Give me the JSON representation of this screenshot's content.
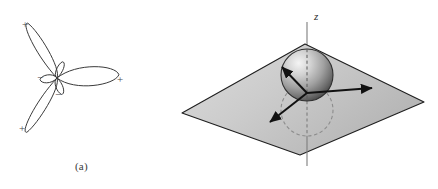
{
  "figure": {
    "panels": [
      {
        "id": "a",
        "caption": "(a)",
        "kind": "orbital-lobe-diagram",
        "description": "Three-lobed angular wavefunction with alternating sign lobes",
        "center": {
          "x": 57,
          "y": 78
        },
        "major_lobes": [
          {
            "angle_deg": 118,
            "length": 62,
            "width": 19,
            "sign": "+",
            "sign_x": 25,
            "sign_y": 25
          },
          {
            "angle_deg": 3,
            "length": 62,
            "width": 19,
            "sign": "+",
            "sign_x": 120,
            "sign_y": 80
          },
          {
            "angle_deg": 241,
            "length": 62,
            "width": 19,
            "sign": "+",
            "sign_x": 22,
            "sign_y": 129
          }
        ],
        "minor_lobes": [
          {
            "angle_deg": 72,
            "length": 17,
            "width": 8,
            "sign": "",
            "sign_x": 0,
            "sign_y": 0
          },
          {
            "angle_deg": 185,
            "length": 17,
            "width": 8,
            "sign": "−",
            "sign_x": 40,
            "sign_y": 78
          },
          {
            "angle_deg": 285,
            "length": 17,
            "width": 8,
            "sign": "−",
            "sign_x": 58,
            "sign_y": 95
          }
        ],
        "signs": {
          "positive": "+",
          "negative": "−"
        }
      },
      {
        "id": "b",
        "caption": "(b)",
        "kind": "sphere-on-plane-diagram",
        "axis_label": "z",
        "plane": {
          "corners": [
            {
              "x": 22,
              "y": 113
            },
            {
              "x": 145,
              "y": 44
            },
            {
              "x": 264,
              "y": 102
            },
            {
              "x": 140,
              "y": 155
            }
          ]
        },
        "sphere": {
          "cx": 147,
          "cy": 75,
          "r": 26
        },
        "shadow_circle": {
          "cx": 147,
          "cy": 110,
          "r": 26
        },
        "axis_line": {
          "x": 147,
          "y_top": 22,
          "y_bottom": 166
        },
        "arrows": [
          {
            "name": "arrow-upper-left",
            "x1": 147,
            "y1": 93,
            "x2": 122,
            "y2": 67
          },
          {
            "name": "arrow-right",
            "x1": 147,
            "y1": 93,
            "x2": 212,
            "y2": 88
          },
          {
            "name": "arrow-lower-left",
            "x1": 147,
            "y1": 93,
            "x2": 110,
            "y2": 122
          }
        ]
      }
    ]
  },
  "colors": {
    "outline": "#3a3a3a",
    "plane_fill_light": "#d8d8d8",
    "plane_fill_dark": "#b2b2b2",
    "plane_edge": "#1f1f1f",
    "sphere_highlight": "#f2f2f2",
    "sphere_mid": "#a8a8a8",
    "sphere_shadow": "#4e4e4e",
    "shadow_circle_stroke": "#8c8c8c",
    "axis_stroke": "#7d7d7d",
    "arrow_stroke": "#111111",
    "background": "#ffffff",
    "text": "#3a3a3a"
  }
}
